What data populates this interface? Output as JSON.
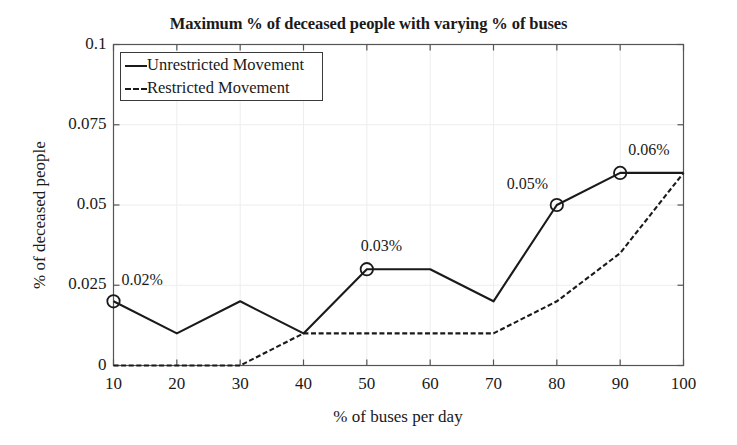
{
  "chart_data": {
    "type": "line",
    "title": "Maximum % of deceased people with varying % of buses",
    "xlabel": "% of buses per day",
    "ylabel": "% of deceased people",
    "x": [
      10,
      20,
      30,
      40,
      50,
      60,
      70,
      80,
      90,
      100
    ],
    "xlim": [
      10,
      100
    ],
    "ylim": [
      0,
      0.1
    ],
    "xticks": [
      "10",
      "20",
      "30",
      "40",
      "50",
      "60",
      "70",
      "80",
      "90",
      "100"
    ],
    "yticks": [
      "0",
      "0.025",
      "0.05",
      "0.075",
      "0.1"
    ],
    "ytick_values": [
      0,
      0.025,
      0.05,
      0.075,
      0.1
    ],
    "grid": true,
    "legend_position": "top-left",
    "series": [
      {
        "name": "Unrestricted Movement",
        "style": "solid",
        "color": "#1a1a1a",
        "values": [
          0.02,
          0.01,
          0.02,
          0.01,
          0.03,
          0.03,
          0.02,
          0.05,
          0.06,
          0.06
        ]
      },
      {
        "name": "Restricted Movement",
        "style": "dashed",
        "color": "#1a1a1a",
        "values": [
          0,
          0,
          0,
          0.01,
          0.01,
          0.01,
          0.01,
          0.02,
          0.035,
          0.06
        ]
      }
    ],
    "annotations": [
      {
        "label": "0.02%",
        "x": 10,
        "y": 0.02,
        "marker": "circle"
      },
      {
        "label": "0.03%",
        "x": 50,
        "y": 0.03,
        "marker": "circle"
      },
      {
        "label": "0.05%",
        "x": 80,
        "y": 0.05,
        "marker": "circle"
      },
      {
        "label": "0.06%",
        "x": 90,
        "y": 0.06,
        "marker": "circle"
      }
    ]
  },
  "legend": {
    "items": [
      {
        "label": "Unrestricted Movement"
      },
      {
        "label": "Restricted Movement"
      }
    ]
  }
}
